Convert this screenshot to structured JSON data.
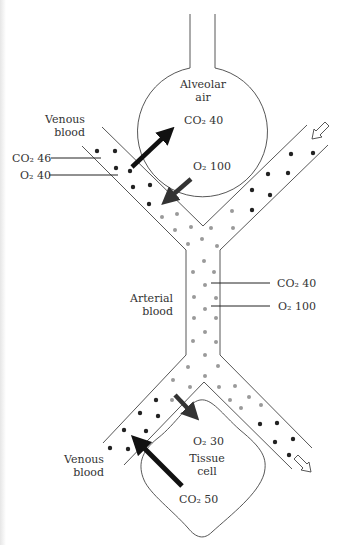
{
  "diagram": {
    "labels": {
      "alveolar_line1": "Alveolar",
      "alveolar_line2": "air",
      "alveolar_co2": "CO₂ 40",
      "alveolar_o2": "O₂ 100",
      "venous_top_line1": "Venous",
      "venous_top_line2": "blood",
      "venous_top_co2": "CO₂ 46",
      "venous_top_o2": "O₂ 40",
      "arterial_line1": "Arterial",
      "arterial_line2": "blood",
      "arterial_co2": "CO₂ 40",
      "arterial_o2": "O₂ 100",
      "tissue_o2": "O₂ 30",
      "tissue_line1": "Tissue",
      "tissue_line2": "cell",
      "tissue_co2": "CO₂ 50",
      "venous_bottom_line1": "Venous",
      "venous_bottom_line2": "blood"
    },
    "colors": {
      "line": "#444444",
      "venous_dot": "#222222",
      "arterial_dot": "#9a9a9a",
      "arrow": "#111111",
      "text": "#333333"
    },
    "flows": [
      {
        "name": "co2-to-alveolus",
        "direction": "out of venous blood into alveolar air"
      },
      {
        "name": "o2-to-blood",
        "direction": "from alveolar air into blood"
      },
      {
        "name": "o2-to-tissue",
        "direction": "from arterial blood into tissue cell"
      },
      {
        "name": "co2-to-venous",
        "direction": "from tissue cell into venous blood"
      }
    ]
  }
}
